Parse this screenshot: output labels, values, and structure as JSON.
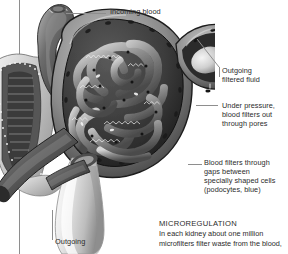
{
  "figure": {
    "style": "grayscale-anatomical-illustration",
    "ink_color": "#2b2b2b",
    "leader_color": "#8e8e8e",
    "background": "#ffffff"
  },
  "labels": {
    "incoming_blood": "Incoming blood",
    "outgoing_filtered_fluid": "Outgoing\nfiltered fluid",
    "under_pressure": "Under pressure,\nblood filters out\nthrough pores",
    "blood_filters_gaps": "Blood filters through\ngaps between\nspecially shaped cells\n(podocytes, blue)",
    "outgoing": "Outgoing"
  },
  "caption": {
    "heading": "MICROREGULATION",
    "body": "In each kidney about one million\nmicrofilters filter waste from the blood,"
  }
}
